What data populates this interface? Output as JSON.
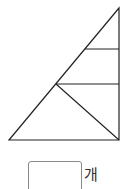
{
  "figure": {
    "stroke_color": "#222222",
    "outer_triangle": {
      "apex": [
        119,
        8
      ],
      "bottom_left": [
        9,
        140
      ],
      "bottom_right": [
        119,
        140
      ]
    },
    "segments": [
      {
        "name": "upper-horizontal",
        "from": [
          85,
          49
        ],
        "to": [
          119,
          49
        ]
      },
      {
        "name": "middle-horizontal",
        "from": [
          56,
          84
        ],
        "to": [
          119,
          84
        ]
      },
      {
        "name": "inner-diagonal",
        "from": [
          56,
          84
        ],
        "to": [
          119,
          140
        ]
      }
    ]
  },
  "answer": {
    "value": "",
    "unit": "개"
  }
}
